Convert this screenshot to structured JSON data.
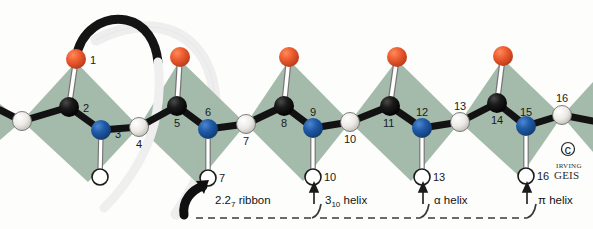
{
  "figure": {
    "background_color": "#fdfdfc",
    "width": 593,
    "height": 229
  },
  "colors": {
    "oxygen": "#e8532a",
    "oxygen_dark": "#b8391a",
    "carbon": "#141414",
    "nitrogen": "#1f5aa8",
    "nitrogen_dark": "#143a72",
    "hydrogen_fill": "#ffffff",
    "alpha_carbon_fill": "#f2f2f0",
    "peptide_plane_green": "#9cb4a4",
    "peptide_plane_green_dark": "#89a492",
    "bond_black": "#121212",
    "ribbon_dark": "#141414",
    "ribbon_light": "#ededed",
    "dashed_line": "#3a3a3a"
  },
  "backbone_atoms": [
    {
      "id": "a-start",
      "number": "",
      "kind": "alpha-carbon",
      "x": 22,
      "y": 121,
      "r": 9
    },
    {
      "id": "a2",
      "number": "2",
      "kind": "carbon",
      "x": 69,
      "y": 107,
      "r": 10,
      "label_dx": 13,
      "label_dy": 3
    },
    {
      "id": "a3",
      "number": "3",
      "kind": "nitrogen",
      "x": 101,
      "y": 130,
      "r": 10,
      "label_dx": 13,
      "label_dy": 6
    },
    {
      "id": "a4",
      "number": "4",
      "kind": "alpha-carbon",
      "x": 139,
      "y": 127,
      "r": 9,
      "label_dx": 1,
      "label_dy": 18
    },
    {
      "id": "a5",
      "number": "5",
      "kind": "carbon",
      "x": 177,
      "y": 106,
      "r": 10,
      "label_dx": 0,
      "label_dy": 19
    },
    {
      "id": "a6",
      "number": "6",
      "kind": "nitrogen",
      "x": 208,
      "y": 129,
      "r": 10,
      "label_dx": 0,
      "label_dy": -14
    },
    {
      "id": "a7",
      "number": "7",
      "kind": "alpha-carbon",
      "x": 246,
      "y": 124,
      "r": 9,
      "label_dx": 0,
      "label_dy": 18
    },
    {
      "id": "a8",
      "number": "8",
      "kind": "carbon",
      "x": 284,
      "y": 106,
      "r": 10,
      "label_dx": 0,
      "label_dy": 19
    },
    {
      "id": "a9",
      "number": "9",
      "kind": "nitrogen",
      "x": 313,
      "y": 128,
      "r": 10,
      "label_dx": 0,
      "label_dy": -14
    },
    {
      "id": "a10",
      "number": "10",
      "kind": "alpha-carbon",
      "x": 350,
      "y": 122,
      "r": 9,
      "label_dx": 0,
      "label_dy": 18
    },
    {
      "id": "a11",
      "number": "11",
      "kind": "carbon",
      "x": 390,
      "y": 106,
      "r": 10,
      "label_dx": 0,
      "label_dy": 20
    },
    {
      "id": "a12",
      "number": "12",
      "kind": "nitrogen",
      "x": 422,
      "y": 128,
      "r": 10,
      "label_dx": 0,
      "label_dy": -14
    },
    {
      "id": "a13",
      "number": "13",
      "kind": "alpha-carbon",
      "x": 460,
      "y": 122,
      "r": 9,
      "label_dx": 0,
      "label_dy": -14
    },
    {
      "id": "a14",
      "number": "14",
      "kind": "carbon",
      "x": 497,
      "y": 103,
      "r": 10,
      "label_dx": 0,
      "label_dy": 20
    },
    {
      "id": "a15",
      "number": "15",
      "kind": "nitrogen",
      "x": 526,
      "y": 126,
      "r": 10,
      "label_dx": 0,
      "label_dy": -14
    },
    {
      "id": "a16",
      "number": "16",
      "kind": "alpha-carbon",
      "x": 562,
      "y": 115,
      "r": 9,
      "label_dx": 0,
      "label_dy": -14
    }
  ],
  "oxygen_atoms": [
    {
      "id": "o1",
      "number": "1",
      "x": 76,
      "y": 59,
      "r": 10,
      "bond_to": "a2",
      "label_dx": 13,
      "label_dy": 4
    },
    {
      "id": "o5",
      "number": "",
      "x": 180,
      "y": 57,
      "r": 10,
      "bond_to": "a5"
    },
    {
      "id": "o8",
      "number": "",
      "x": 289,
      "y": 57,
      "r": 10,
      "bond_to": "a8"
    },
    {
      "id": "o11",
      "number": "",
      "x": 397,
      "y": 57,
      "r": 10,
      "bond_to": "a11"
    },
    {
      "id": "o14",
      "number": "",
      "x": 503,
      "y": 56,
      "r": 10,
      "bond_to": "a14"
    }
  ],
  "hydrogen_atoms": [
    {
      "id": "h3",
      "number": "",
      "x": 100,
      "y": 177,
      "r": 8,
      "bond_to": "a3"
    },
    {
      "id": "h6",
      "number": "7",
      "x": 208,
      "y": 178,
      "r": 8,
      "bond_to": "a6",
      "label_dx": 12,
      "label_dy": 4
    },
    {
      "id": "h9",
      "number": "10",
      "x": 313,
      "y": 177,
      "r": 8,
      "bond_to": "a9",
      "label_dx": 12,
      "label_dy": 4
    },
    {
      "id": "h12",
      "number": "13",
      "x": 422,
      "y": 177,
      "r": 8,
      "bond_to": "a12",
      "label_dx": 12,
      "label_dy": 4
    },
    {
      "id": "h15",
      "number": "16",
      "x": 526,
      "y": 176,
      "r": 8,
      "bond_to": "a15",
      "label_dx": 12,
      "label_dy": 4
    }
  ],
  "peptide_planes": [
    {
      "id": "plane-1",
      "points": "22,121 76,62 139,127 88,182",
      "shade": "light"
    },
    {
      "id": "plane-2",
      "points": "139,127 180,60 246,124 197,183",
      "shade": "light"
    },
    {
      "id": "plane-3",
      "points": "246,124 289,60 350,122 303,181",
      "shade": "light"
    },
    {
      "id": "plane-4",
      "points": "350,122 397,60 460,122 411,181",
      "shade": "light"
    },
    {
      "id": "plane-5",
      "points": "460,122 503,59 562,116 520,177",
      "shade": "light"
    },
    {
      "id": "plane-6",
      "points": "562,116 593,88 593,150",
      "shade": "light"
    }
  ],
  "region_annotations": [
    {
      "id": "region-22-ribbon",
      "label_main": "2.2",
      "label_sub": "7",
      "label_tail": " ribbon",
      "label_x": 224,
      "label_y": 203,
      "arrow_x": 209,
      "arrow_y": 186,
      "dash_x1": 196,
      "dash_x2": 318,
      "dash_y": 218,
      "arrow_style": "thick-curved"
    },
    {
      "id": "region-310-helix",
      "label_main": "3",
      "label_sub": "10",
      "label_tail": " helix",
      "label_x": 325,
      "label_y": 203,
      "arrow_x": 314,
      "arrow_y": 186,
      "dash_x1": 325,
      "dash_x2": 425,
      "dash_y": 218,
      "arrow_style": "thin"
    },
    {
      "id": "region-alpha-helix",
      "label_main": "α",
      "label_sub": "",
      "label_tail": " helix",
      "label_x": 433,
      "label_y": 203,
      "arrow_x": 423,
      "arrow_y": 186,
      "dash_x1": 432,
      "dash_x2": 530,
      "dash_y": 218,
      "arrow_style": "thin"
    },
    {
      "id": "region-pi-helix",
      "label_main": "π",
      "label_sub": "",
      "label_tail": " helix",
      "label_x": 537,
      "label_y": 203,
      "arrow_x": 527,
      "arrow_y": 186,
      "dash_x1": 0,
      "dash_x2": 0,
      "dash_y": 218,
      "arrow_style": "thin"
    }
  ],
  "signature": {
    "copyright_symbol": "©",
    "name_line1": "IRVING",
    "name_line2": "GEIS",
    "x": 563,
    "y": 152
  },
  "ribbon": {
    "description": "helical ribbon arc rising from oxygen 1 and descending to the right",
    "dark_color": "#141414",
    "light_color": "#ededed"
  }
}
